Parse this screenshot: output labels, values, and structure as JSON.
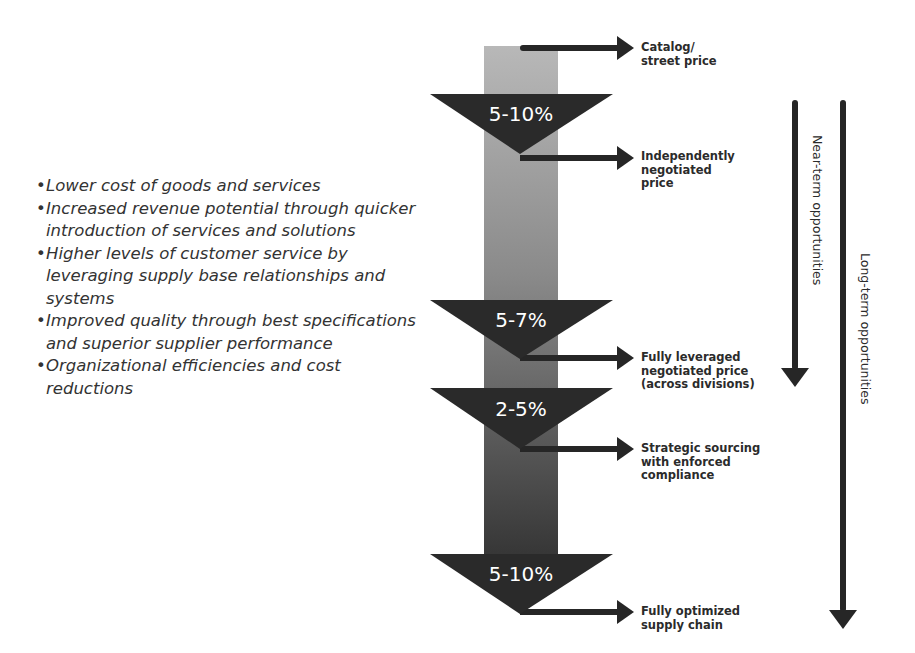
{
  "benefits": [
    "Lower cost of goods and services",
    "Increased revenue potential through quicker introduction of services and solutions",
    "Higher levels of customer service by leveraging supply base relationships and systems",
    "Improved quality through best specifications and superior supplier performance",
    "Organizational efficiencies and cost reductions"
  ],
  "steps": [
    {
      "savings": "5-10%",
      "label_after": "Independently negotiated price"
    },
    {
      "savings": "5-7%",
      "label_after": "Fully leveraged negotiated price (across divisions)"
    },
    {
      "savings": "2-5%",
      "label_after": "Strategic sourcing with enforced compliance"
    },
    {
      "savings": "5-10%",
      "label_after": "Fully optimized supply chain"
    }
  ],
  "price_levels": [
    {
      "line1": "Catalog/",
      "line2": "street price",
      "line3": ""
    },
    {
      "line1": "Independently",
      "line2": "negotiated",
      "line3": "price"
    },
    {
      "line1": "Fully leveraged",
      "line2": "negotiated price",
      "line3": "(across divisions)"
    },
    {
      "line1": "Strategic sourcing",
      "line2": "with enforced",
      "line3": "compliance"
    },
    {
      "line1": "Fully optimized",
      "line2": "supply chain",
      "line3": ""
    }
  ],
  "horizons": {
    "near_term": "Near-term opportunities",
    "long_term": "Long-term opportunities"
  },
  "colors": {
    "column_top": "#b4b4b4",
    "column_bottom": "#3a3a3a",
    "triangle": "#2a2a2a",
    "arrow": "#262626"
  }
}
